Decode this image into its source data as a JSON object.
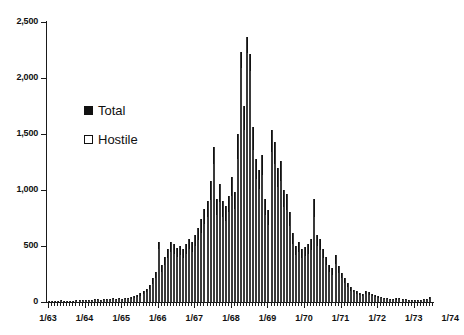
{
  "chart_data": {
    "type": "bar",
    "title": "",
    "subtitle": "",
    "xlabel": "",
    "ylabel": "",
    "ylim": [
      0,
      2500
    ],
    "ytick_labels": [
      "0",
      "500",
      "1,000",
      "1,500",
      "2,000",
      "2,500"
    ],
    "ytick_values": [
      0,
      500,
      1000,
      1500,
      2000,
      2500
    ],
    "xtick_labels": [
      "1/63",
      "1/64",
      "1/65",
      "1/66",
      "1/67",
      "1/68",
      "1/69",
      "1/70",
      "1/71",
      "1/72",
      "1/73",
      "1/74"
    ],
    "grid": false,
    "legend_position": "upper-left-inside",
    "stacked": true,
    "minor_ticks": "monthly",
    "legend": [
      {
        "name": "Total",
        "swatch": "filled-black-square"
      },
      {
        "name": "Hostile",
        "swatch": "open-white-square"
      }
    ],
    "series": [
      {
        "name": "Total",
        "values": [
          6,
          8,
          12,
          10,
          14,
          9,
          11,
          13,
          12,
          15,
          14,
          16,
          18,
          20,
          22,
          24,
          26,
          22,
          25,
          28,
          30,
          32,
          28,
          34,
          30,
          36,
          40,
          44,
          52,
          60,
          78,
          96,
          120,
          150,
          210,
          270,
          540,
          330,
          400,
          470,
          540,
          520,
          480,
          500,
          470,
          520,
          560,
          540,
          600,
          660,
          740,
          830,
          900,
          1080,
          1380,
          920,
          1050,
          900,
          860,
          950,
          1120,
          980,
          1500,
          2230,
          1750,
          2370,
          2210,
          1560,
          1280,
          1180,
          1310,
          920,
          820,
          1540,
          1430,
          1200,
          1260,
          1000,
          960,
          800,
          620,
          500,
          540,
          470,
          490,
          520,
          560,
          920,
          600,
          560,
          470,
          400,
          330,
          300,
          420,
          320,
          260,
          210,
          170,
          130,
          110,
          95,
          80,
          70,
          100,
          85,
          70,
          60,
          55,
          45,
          40,
          35,
          30,
          28,
          32,
          38,
          30,
          26,
          22,
          20,
          18,
          16,
          20,
          24,
          30,
          45
        ]
      },
      {
        "name": "Hostile",
        "values": [
          4,
          6,
          9,
          7,
          10,
          6,
          8,
          9,
          8,
          11,
          10,
          12,
          13,
          15,
          16,
          18,
          19,
          16,
          18,
          21,
          22,
          24,
          20,
          25,
          22,
          27,
          30,
          33,
          39,
          45,
          58,
          72,
          92,
          115,
          165,
          215,
          470,
          270,
          330,
          390,
          450,
          430,
          400,
          420,
          390,
          430,
          470,
          450,
          500,
          550,
          620,
          700,
          760,
          910,
          1230,
          780,
          890,
          760,
          720,
          800,
          950,
          830,
          1280,
          2090,
          1540,
          2220,
          2060,
          1360,
          1100,
          1010,
          1130,
          780,
          690,
          1340,
          1230,
          1030,
          1080,
          850,
          820,
          680,
          520,
          420,
          450,
          390,
          410,
          430,
          460,
          760,
          500,
          460,
          390,
          330,
          270,
          245,
          340,
          260,
          210,
          170,
          135,
          100,
          85,
          72,
          60,
          52,
          76,
          64,
          52,
          44,
          40,
          32,
          28,
          25,
          21,
          19,
          22,
          27,
          21,
          18,
          15,
          13,
          12,
          10,
          13,
          16,
          20,
          30
        ]
      }
    ]
  }
}
